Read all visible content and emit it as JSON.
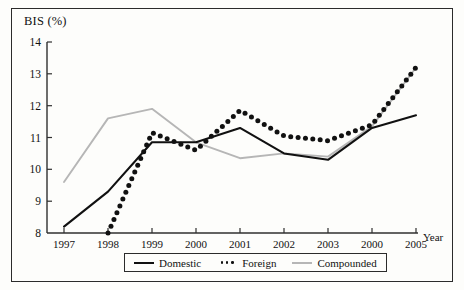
{
  "figure": {
    "y_axis_title": "BIS (%)",
    "x_axis_title": "Year"
  },
  "legend": {
    "items": [
      {
        "label": "Domestic",
        "style": "solid",
        "color": "#111111",
        "icon": "solid-line-swatch"
      },
      {
        "label": "Foreign",
        "style": "dotted",
        "color": "#111111",
        "icon": "dotted-line-swatch"
      },
      {
        "label": "Compounded",
        "style": "solid",
        "color": "#b6b6b6",
        "icon": "gray-line-swatch"
      }
    ]
  },
  "chart_data": {
    "type": "line",
    "title": "",
    "xlabel": "Year",
    "ylabel": "BIS (%)",
    "categories": [
      "1997",
      "1998",
      "1999",
      "2000",
      "2001",
      "2002",
      "2003",
      "2000",
      "2005"
    ],
    "x_tick_labels": [
      "1997",
      "1998",
      "1999",
      "2000",
      "2001",
      "2002",
      "2003",
      "2000",
      "2005"
    ],
    "y_tick_labels": [
      "8",
      "9",
      "10",
      "11",
      "12",
      "13",
      "14"
    ],
    "ylim": [
      8,
      14
    ],
    "y_ticks": [
      8,
      9,
      10,
      11,
      12,
      13,
      14
    ],
    "grid": false,
    "legend_position": "bottom-center",
    "series": [
      {
        "name": "Domestic",
        "color": "#111111",
        "style": "solid",
        "values": [
          8.2,
          9.3,
          10.85,
          10.85,
          11.3,
          10.5,
          10.3,
          11.3,
          11.7
        ]
      },
      {
        "name": "Foreign",
        "color": "#111111",
        "style": "dotted",
        "values": [
          null,
          8.0,
          11.15,
          10.6,
          11.85,
          11.05,
          10.9,
          11.4,
          13.2
        ],
        "note": "Series begins mid-1998 near 8.0"
      },
      {
        "name": "Compounded",
        "color": "#b6b6b6",
        "style": "solid",
        "values": [
          9.6,
          11.6,
          11.9,
          10.85,
          10.35,
          10.5,
          10.4,
          11.35,
          13.2
        ]
      }
    ]
  }
}
